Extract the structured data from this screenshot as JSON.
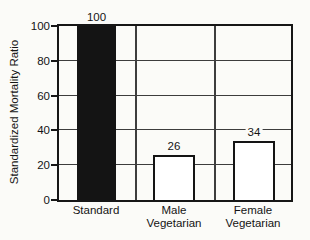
{
  "chart_data": {
    "type": "bar",
    "title": "",
    "ylabel": "Standardized Mortality Ratio",
    "xlabel": "",
    "ylim": [
      0,
      100
    ],
    "yticks": [
      0,
      20,
      40,
      60,
      80,
      100
    ],
    "grid": true,
    "legend_position": "none",
    "categories": [
      "Standard",
      "Male Vegetarian",
      "Female Vegetarian"
    ],
    "category_label_lines": [
      [
        "Standard"
      ],
      [
        "Male",
        "Vegetarian"
      ],
      [
        "Female",
        "Vegetarian"
      ]
    ],
    "values": [
      100,
      26,
      34
    ],
    "value_labels": [
      "100",
      "26",
      "34"
    ],
    "bar_fills": [
      "#141414",
      "#ffffff",
      "#ffffff"
    ],
    "colors": {
      "axis": "#161616",
      "gridline": "#3d3d3d",
      "text": "#141414",
      "background": "#fbfbf8"
    }
  }
}
